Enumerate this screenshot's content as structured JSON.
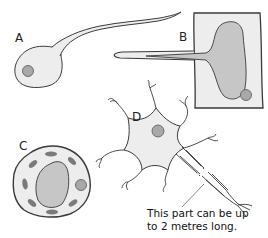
{
  "diagram": {
    "type": "cell types illustration",
    "cells": [
      {
        "id": "A",
        "label": "A",
        "description": "sperm-like cell with round body, nucleus and long tail"
      },
      {
        "id": "B",
        "label": "B",
        "description": "rectangular cell with large vacuole extending into a long tube-like projection and small nucleus"
      },
      {
        "id": "C",
        "label": "C",
        "description": "hexagonal plant-like cell with central vacuole, chloroplasts and nucleus"
      },
      {
        "id": "D",
        "label": "D",
        "description": "neuron with cell body, nucleus, branching dendrites and long axon"
      }
    ],
    "caption_line1": "This part can be up",
    "caption_line2": "to 2 metres long."
  },
  "colors": {
    "outline": "#3a3a3a",
    "cytoplasm": "#ededed",
    "vacuole": "#c6c6c6",
    "nucleus": "#a8a8a8",
    "chloroplast": "#7a7a7a"
  }
}
